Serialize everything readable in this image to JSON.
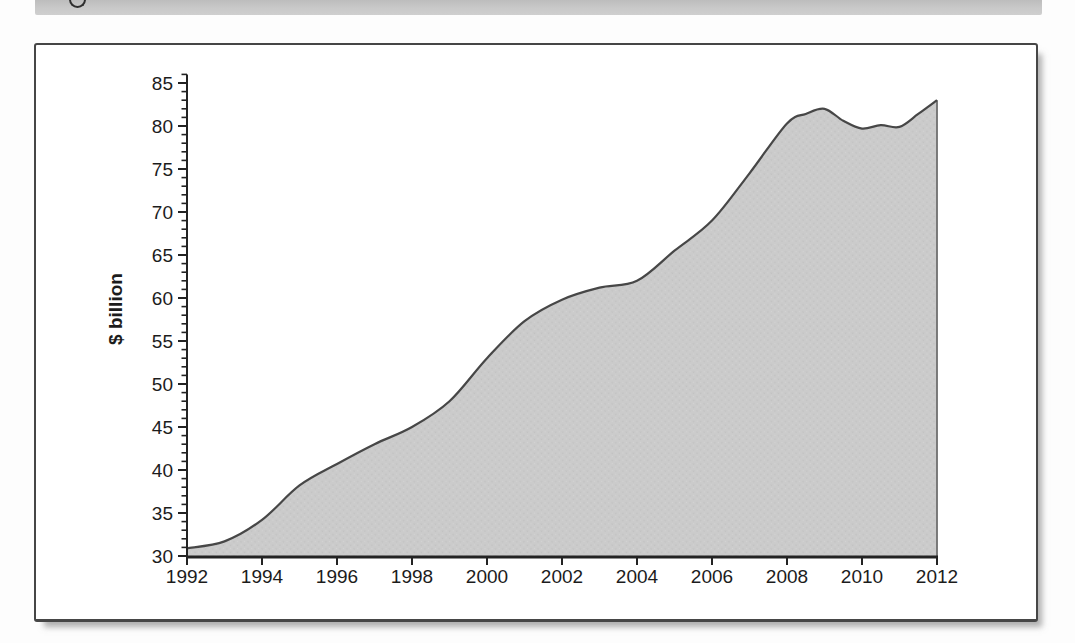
{
  "page": {
    "top_band_color": "#c9c9c9",
    "figure_border_color": "#464646",
    "background_color": "#ffffff"
  },
  "chart_data": {
    "type": "area",
    "title": "",
    "xlabel": "",
    "ylabel": "$ billion",
    "x_range": [
      1992,
      2012
    ],
    "ylim": [
      30,
      85
    ],
    "x_tick_step": 2,
    "y_tick_step": 5,
    "y_minor_tick_step": 1,
    "grid": "off",
    "legend": "none",
    "x_tick_labels": [
      "1992",
      "1994",
      "1996",
      "1998",
      "2000",
      "2002",
      "2004",
      "2006",
      "2008",
      "2010",
      "2012"
    ],
    "y_tick_labels": [
      "30",
      "35",
      "40",
      "45",
      "50",
      "55",
      "60",
      "65",
      "70",
      "75",
      "80",
      "85"
    ],
    "years": [
      1992,
      1993,
      1994,
      1995,
      1996,
      1997,
      1998,
      1999,
      2000,
      2001,
      2002,
      2003,
      2004,
      2005,
      2006,
      2007,
      2008,
      2009,
      2010,
      2011,
      2012
    ],
    "values": [
      30.9,
      31.7,
      34.2,
      38.2,
      40.7,
      43.0,
      45.0,
      48.0,
      53.0,
      57.3,
      59.8,
      61.2,
      62.0,
      65.5,
      69.0,
      74.5,
      80.3,
      82.0,
      79.7,
      79.9,
      83.0
    ],
    "points": [
      [
        1992,
        30.9
      ],
      [
        1993,
        31.7
      ],
      [
        1994,
        34.2
      ],
      [
        1995,
        38.2
      ],
      [
        1996,
        40.7
      ],
      [
        1997,
        43.0
      ],
      [
        1998,
        45.0
      ],
      [
        1999,
        48.0
      ],
      [
        2000,
        53.0
      ],
      [
        2001,
        57.3
      ],
      [
        2002,
        59.8
      ],
      [
        2003,
        61.2
      ],
      [
        2004,
        62.0
      ],
      [
        2005,
        65.5
      ],
      [
        2006,
        69.0
      ],
      [
        2007,
        74.5
      ],
      [
        2008,
        80.3
      ],
      [
        2008.5,
        81.4
      ],
      [
        2009,
        82.0
      ],
      [
        2009.5,
        80.6
      ],
      [
        2010,
        79.7
      ],
      [
        2010.5,
        80.1
      ],
      [
        2011,
        79.9
      ],
      [
        2011.5,
        81.4
      ],
      [
        2012,
        83.0
      ]
    ],
    "fill_color": "#cbcbcb",
    "fill_dot_dark": "#c0c0c0",
    "fill_dot_light": "#d4d4d4",
    "line_color": "#474747",
    "right_edge_color": "#6f6f6f",
    "axis_color": "#232323"
  }
}
